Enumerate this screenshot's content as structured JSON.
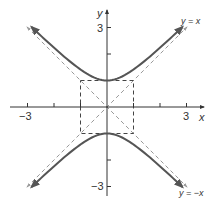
{
  "chart_data": {
    "type": "line",
    "title": "",
    "xlabel": "x",
    "ylabel": "y",
    "xlim": [
      -4,
      4
    ],
    "ylim": [
      -4,
      4
    ],
    "x_ticks": [
      -3,
      -2,
      -1,
      1,
      2,
      3
    ],
    "y_ticks": [
      -3,
      -2,
      -1,
      1,
      2,
      3
    ],
    "x_tick_labels": {
      "neg": "−3",
      "pos": "3"
    },
    "y_tick_labels": {
      "neg": "−3",
      "pos": "3"
    },
    "grid": false,
    "series": [
      {
        "name": "hyperbola upper branch",
        "equation": "y^2 - x^2 = 1, y>0",
        "style": "solid",
        "color": "#555555"
      },
      {
        "name": "hyperbola lower branch",
        "equation": "y^2 - x^2 = 1, y<0",
        "style": "solid",
        "color": "#555555"
      },
      {
        "name": "asymptote y = x",
        "style": "dashed",
        "color": "#999999"
      },
      {
        "name": "asymptote y = -x",
        "style": "dashed",
        "color": "#999999"
      },
      {
        "name": "fundamental rectangle",
        "corners": [
          [
            -1,
            -1
          ],
          [
            1,
            -1
          ],
          [
            1,
            1
          ],
          [
            -1,
            1
          ]
        ],
        "style": "dashed",
        "color": "#444444"
      }
    ],
    "annotations": [
      {
        "text": "y = x",
        "position": "upper right"
      },
      {
        "text": "y = −x",
        "position": "lower right"
      }
    ]
  },
  "labels": {
    "x_axis": "x",
    "y_axis": "y",
    "tick_x_neg": "−3",
    "tick_x_pos": "3",
    "tick_y_pos": "3",
    "tick_y_neg": "−3",
    "asym_pos": "y = x",
    "asym_neg": "y = −x"
  }
}
